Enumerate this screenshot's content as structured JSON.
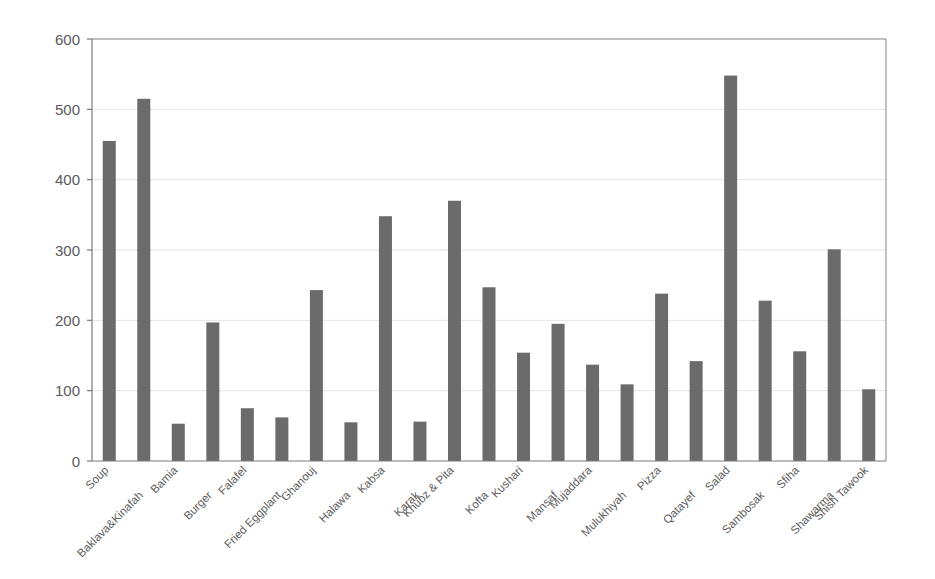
{
  "chart_data": {
    "type": "bar",
    "title": "",
    "subtitle": "",
    "xlabel": "",
    "ylabel": "",
    "ylim": [
      0,
      600
    ],
    "y_ticks": [
      0,
      100,
      200,
      300,
      400,
      500,
      600
    ],
    "grid": true,
    "legend": "none",
    "bar_color": "#6b6b6b",
    "background_color": "#ffffff",
    "gridline_color": "#e3e3e3",
    "axis_color": "#7a7a7a",
    "label_rotation_degrees": 45,
    "label_stagger": "alternating-two-rows",
    "categories": [
      "Soup",
      "Baklava&Kinafah",
      "Bamia",
      "Burger",
      "Falafel",
      "Fried Eggplant",
      "Ghanouj",
      "Halawa",
      "Kabsa",
      "Karak",
      "Khubz & Pita",
      "Kofta",
      "Kushari",
      "Mansaf",
      "Mujaddara",
      "Mulukhiyah",
      "Pizza",
      "Qatayef",
      "Salad",
      "Sambosak",
      "Sfiha",
      "Shawarma",
      "Shish Tawook"
    ],
    "values": [
      455,
      515,
      53,
      197,
      75,
      62,
      243,
      55,
      348,
      56,
      370,
      247,
      154,
      195,
      137,
      109,
      238,
      142,
      548,
      228,
      156,
      301,
      102
    ]
  }
}
